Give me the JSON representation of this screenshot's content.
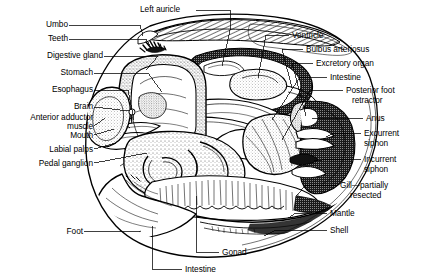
{
  "figure": {
    "background_color": "#ffffff",
    "ink_color": "#000000",
    "width": 423,
    "height": 280
  },
  "labels": {
    "left_auricle": "Left auricle",
    "umbo": "Umbo",
    "teeth": "Teeth",
    "digestive_gland": "Digestive gland",
    "stomach": "Stomach",
    "esophagus": "Esophagus",
    "brain": "Brain",
    "anterior_adductor_muscle_1": "Anterior adductor",
    "anterior_adductor_muscle_2": "muscle",
    "mouth": "Mouth",
    "labial_palps": "Labial palps",
    "pedal_ganglion": "Pedal ganglion",
    "foot": "Foot",
    "intestine_bottom": "Intestine",
    "gonad": "Gonad",
    "ventricle": "Ventricle",
    "bulbus_arteriosus": "Bulbus arteriosus",
    "excretory_organ": "Excretory organ",
    "intestine_right": "Intestine",
    "posterior_foot_retractor_1": "Posterior foot",
    "posterior_foot_retractor_2": "retractor",
    "anus": "Anus",
    "excurrent_siphon_1": "Excurrent",
    "excurrent_siphon_2": "siphon",
    "incurrent_siphon_1": "Incurrent",
    "incurrent_siphon_2": "siphon",
    "gill_1": "Gill—partially",
    "gill_2": "resected",
    "mantle": "Mantle",
    "shell": "Shell"
  },
  "label_positions": {
    "left_auricle": {
      "x": 140,
      "y": 6,
      "align": "left"
    },
    "umbo": {
      "x": 36,
      "y": 21,
      "align": "right",
      "w": 66
    },
    "teeth": {
      "x": 36,
      "y": 35,
      "align": "right",
      "w": 66
    },
    "digestive_gland": {
      "x": 6,
      "y": 52,
      "align": "right",
      "w": 96
    },
    "stomach": {
      "x": 6,
      "y": 69,
      "align": "right",
      "w": 86
    },
    "esophagus": {
      "x": 6,
      "y": 86,
      "align": "right",
      "w": 86
    },
    "brain": {
      "x": 6,
      "y": 103,
      "align": "right",
      "w": 86
    },
    "anterior_adductor": {
      "x": 2,
      "y": 112,
      "align": "right",
      "w": 90
    },
    "mouth": {
      "x": 6,
      "y": 131,
      "align": "right",
      "w": 86
    },
    "labial_palps": {
      "x": 6,
      "y": 145,
      "align": "right",
      "w": 86
    },
    "pedal_ganglion": {
      "x": 2,
      "y": 159,
      "align": "right",
      "w": 90
    },
    "foot": {
      "x": 40,
      "y": 227,
      "align": "right",
      "w": 40
    },
    "intestine_bottom": {
      "x": 185,
      "y": 265,
      "align": "left"
    },
    "gonad": {
      "x": 222,
      "y": 248,
      "align": "left"
    },
    "ventricle": {
      "x": 292,
      "y": 31,
      "align": "left"
    },
    "bulbus_arteriosus": {
      "x": 306,
      "y": 45,
      "align": "left"
    },
    "excretory_organ": {
      "x": 316,
      "y": 59,
      "align": "left"
    },
    "intestine_right": {
      "x": 330,
      "y": 73,
      "align": "left"
    },
    "posterior_foot": {
      "x": 346,
      "y": 86,
      "align": "left"
    },
    "anus": {
      "x": 366,
      "y": 114,
      "align": "left"
    },
    "excurrent_siphon": {
      "x": 364,
      "y": 129,
      "align": "left"
    },
    "incurrent_siphon": {
      "x": 364,
      "y": 155,
      "align": "left"
    },
    "gill": {
      "x": 340,
      "y": 181,
      "align": "left"
    },
    "mantle": {
      "x": 330,
      "y": 209,
      "align": "left"
    },
    "shell": {
      "x": 330,
      "y": 226,
      "align": "left"
    }
  }
}
